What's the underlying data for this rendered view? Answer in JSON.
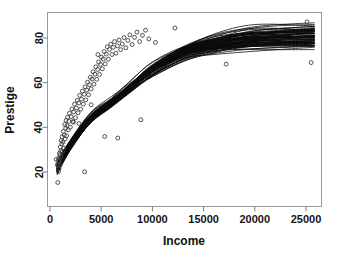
{
  "chart_data": {
    "type": "scatter",
    "title": "",
    "subtitle": "",
    "xlabel": "Income",
    "ylabel": "Prestige",
    "xlim": [
      -600,
      27200
    ],
    "ylim": [
      12,
      89
    ],
    "grid": false,
    "legend": "none",
    "xticks": [
      0,
      5000,
      10000,
      15000,
      20000,
      25000
    ],
    "xtick_labels": [
      "0",
      "5000",
      "10000",
      "15000",
      "20000",
      "25000"
    ],
    "yticks": [
      20,
      40,
      60,
      80
    ],
    "ytick_labels": [
      "20",
      "40",
      "60",
      "80"
    ],
    "annotations": [],
    "marker_style": "open-circle",
    "series": [
      {
        "name": "Occupations",
        "type": "scatter",
        "x": [
          611,
          716,
          760,
          817,
          834,
          848,
          874,
          896,
          918,
          944,
          968,
          1010,
          1030,
          1050,
          1080,
          1120,
          1150,
          1180,
          1220,
          1260,
          1310,
          1350,
          1390,
          1440,
          1480,
          1530,
          1570,
          1620,
          1660,
          1720,
          1780,
          1840,
          1900,
          1990,
          2060,
          2140,
          2230,
          2310,
          2400,
          2490,
          2570,
          2660,
          2740,
          2820,
          2900,
          2990,
          3070,
          3160,
          3250,
          3340,
          3420,
          3500,
          3590,
          3670,
          3760,
          3850,
          3940,
          4020,
          4110,
          4200,
          4290,
          4380,
          4470,
          4560,
          4660,
          4750,
          4840,
          4930,
          5020,
          5110,
          5200,
          5290,
          5390,
          5490,
          5590,
          5700,
          5810,
          5930,
          6050,
          6180,
          6310,
          6450,
          6590,
          6740,
          6900,
          7060,
          7230,
          7410,
          7600,
          7800,
          8020,
          8250,
          8490,
          8750,
          9030,
          9330,
          9650,
          10300,
          12200,
          17200,
          25500,
          25100,
          8870,
          6620,
          5340,
          4680,
          4020,
          3380,
          2840,
          2300
        ],
        "y": [
          25.6,
          23.2,
          15.3,
          25.1,
          20.2,
          26.3,
          21.5,
          24.8,
          28.4,
          22.9,
          27.7,
          31.2,
          23.8,
          29.4,
          34.1,
          26.9,
          32.6,
          35.8,
          29.1,
          33.4,
          38.2,
          30.7,
          36.5,
          41.3,
          34.8,
          39.6,
          43.1,
          36.2,
          40.8,
          44.5,
          38.9,
          42.7,
          46.3,
          40.1,
          44.8,
          48.2,
          42.6,
          46.9,
          50.4,
          44.3,
          48.7,
          52.1,
          46.5,
          50.9,
          54.3,
          48.1,
          52.6,
          56.2,
          50.4,
          54.8,
          58.1,
          52.3,
          56.7,
          60.2,
          54.6,
          59.1,
          62.4,
          57.2,
          61.6,
          64.9,
          59.3,
          63.8,
          67.1,
          61.5,
          65.9,
          69.2,
          63.7,
          68.1,
          71.4,
          66.2,
          70.6,
          73.9,
          68.4,
          72.8,
          76.1,
          70.5,
          74.9,
          77.2,
          72.6,
          75.8,
          78.4,
          73.2,
          76.5,
          79.1,
          74.8,
          77.3,
          80.2,
          75.6,
          78.9,
          81.4,
          77.1,
          80.3,
          82.6,
          78.4,
          81.2,
          83.5,
          79.6,
          78.0,
          84.5,
          68.3,
          69.0,
          87.2,
          43.4,
          35.2,
          35.9,
          72.6,
          50.1,
          20.1,
          41.7,
          42.3
        ]
      }
    ],
    "smoother": {
      "name": "Bootstrap smoothing curves",
      "type": "line",
      "count": 70,
      "description": "Overlaid bootstrap replicate smooth fits of Prestige on Income",
      "x_knots": [
        700,
        2000,
        4000,
        6000,
        8000,
        10000,
        13000,
        16000,
        20000,
        25800
      ],
      "median_y": [
        22.0,
        32.0,
        44.0,
        51.0,
        58.5,
        66.0,
        73.5,
        77.0,
        79.5,
        80.5
      ],
      "lower_y": [
        18.0,
        27.5,
        40.0,
        47.0,
        54.0,
        60.0,
        66.5,
        68.5,
        69.5,
        70.5
      ],
      "upper_y": [
        27.0,
        36.5,
        48.5,
        55.0,
        63.0,
        71.0,
        79.5,
        83.5,
        86.5,
        88.5
      ]
    }
  },
  "axes": {
    "x_title": "Income",
    "y_title": "Prestige"
  }
}
